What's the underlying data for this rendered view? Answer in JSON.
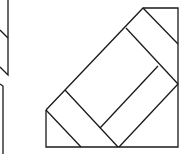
{
  "diagram": {
    "stroke": "#1a1a1a",
    "background": "#ffffff",
    "shapes": [
      {
        "name": "left-partial-figure-top",
        "points": "8,0 8,75 0,67"
      },
      {
        "name": "left-partial-diagonal",
        "points": "0,30 8,38"
      },
      {
        "name": "left-partial-figure-bottom",
        "points": "0,84 3,86 3,154"
      },
      {
        "name": "square-outline",
        "points": "46,110 143,8 178,8 178,147 46,147"
      },
      {
        "name": "corner-cut-bottom-left",
        "points": "46,110 81,147"
      },
      {
        "name": "strip-line-1",
        "points": "65,90 118,147"
      },
      {
        "name": "strip-line-2",
        "points": "126,28 178,84"
      },
      {
        "name": "corner-cut-top-right",
        "points": "143,8 178,44"
      },
      {
        "name": "inner-parallel",
        "points": "158,66 100,128"
      },
      {
        "name": "outer-parallel",
        "points": "178,84 119,147"
      }
    ]
  }
}
